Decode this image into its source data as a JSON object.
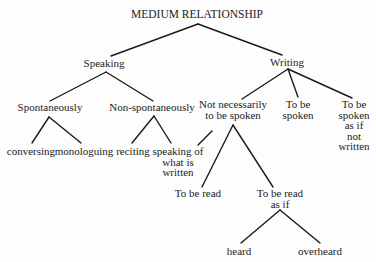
{
  "diagram": {
    "type": "tree",
    "title": "MEDIUM RELATIONSHIP",
    "nodes": [
      {
        "id": "root",
        "lines": [
          "MEDIUM RELATIONSHIP"
        ]
      },
      {
        "id": "speaking",
        "lines": [
          "Speaking"
        ]
      },
      {
        "id": "writing",
        "lines": [
          "Writing"
        ]
      },
      {
        "id": "spontaneously",
        "lines": [
          "Spontaneously"
        ]
      },
      {
        "id": "non-spontaneously",
        "lines": [
          "Non-spontaneously"
        ]
      },
      {
        "id": "conversing",
        "lines": [
          "conversing"
        ]
      },
      {
        "id": "monologuing",
        "lines": [
          "monologuing"
        ]
      },
      {
        "id": "reciting",
        "lines": [
          "reciting"
        ]
      },
      {
        "id": "speaking-of-what-is-written",
        "lines": [
          "speaking of",
          "what is",
          "written"
        ]
      },
      {
        "id": "not-necessarily-to-be-spoken",
        "lines": [
          "Not necessarily",
          "to be spoken"
        ]
      },
      {
        "id": "to-be-spoken",
        "lines": [
          "To be",
          "spoken"
        ]
      },
      {
        "id": "to-be-spoken-as-if-not-written",
        "lines": [
          "To be",
          "spoken",
          "as if",
          "not",
          "written"
        ]
      },
      {
        "id": "to-be-read",
        "lines": [
          "To be read"
        ]
      },
      {
        "id": "to-be-read-as-if",
        "lines": [
          "To be read",
          "as if"
        ]
      },
      {
        "id": "heard",
        "lines": [
          "heard"
        ]
      },
      {
        "id": "overheard",
        "lines": [
          "overheard"
        ]
      }
    ],
    "edges": [
      {
        "from": "root",
        "to": "speaking"
      },
      {
        "from": "root",
        "to": "writing"
      },
      {
        "from": "speaking",
        "to": "spontaneously"
      },
      {
        "from": "speaking",
        "to": "non-spontaneously"
      },
      {
        "from": "spontaneously",
        "to": "conversing"
      },
      {
        "from": "spontaneously",
        "to": "monologuing"
      },
      {
        "from": "non-spontaneously",
        "to": "reciting"
      },
      {
        "from": "non-spontaneously",
        "to": "speaking-of-what-is-written"
      },
      {
        "from": "writing",
        "to": "not-necessarily-to-be-spoken"
      },
      {
        "from": "writing",
        "to": "to-be-spoken"
      },
      {
        "from": "writing",
        "to": "to-be-spoken-as-if-not-written"
      },
      {
        "from": "not-necessarily-to-be-spoken",
        "to": "speaking-of-what-is-written"
      },
      {
        "from": "not-necessarily-to-be-spoken",
        "to": "to-be-read"
      },
      {
        "from": "not-necessarily-to-be-spoken",
        "to": "to-be-read-as-if"
      },
      {
        "from": "to-be-read-as-if",
        "to": "heard"
      },
      {
        "from": "to-be-read-as-if",
        "to": "overheard"
      }
    ]
  }
}
